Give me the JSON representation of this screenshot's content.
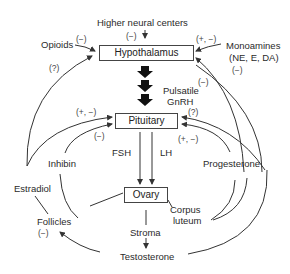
{
  "diagram": {
    "nodes": {
      "higher_neural_centers": "Higher neural centers",
      "hypothalamus": "Hypothalamus",
      "pituitary": "Pituitary",
      "ovary": "Ovary",
      "opioids": "Opioids",
      "monoamines_line1": "Monoamines",
      "monoamines_line2": "(NE, E, DA)",
      "pulsatile_line1": "Pulsatile",
      "pulsatile_line2": "GnRH",
      "fsh": "FSH",
      "lh": "LH",
      "inhibin": "Inhibin",
      "estradiol": "Estradiol",
      "progesterone": "Progesterone",
      "follicles": "Follicles",
      "corpus_line1": "Corpus",
      "corpus_line2": "luteum",
      "stroma": "Stroma",
      "testosterone": "Testosterone"
    },
    "effects": {
      "higher_neural": "(−)",
      "opioids": "(−)",
      "monoamines": "(+, −)",
      "monoamines_lower": "(−)",
      "pulsatile": "(−)",
      "estradiol_hypothalamus": "(?)",
      "estradiol_pituitary": "(+, −)",
      "inhibin_pituitary": "(−)",
      "progesterone_pituitary_top": "(?)",
      "progesterone_pituitary": "(+, −)",
      "follicles": "(−)"
    }
  }
}
